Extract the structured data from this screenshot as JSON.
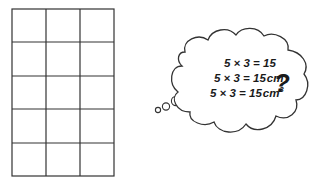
{
  "grid": {
    "columns": 3,
    "rows": 5,
    "x": 12,
    "y": 9,
    "width": 102,
    "height": 167,
    "stroke": "#333333"
  },
  "thought_bubble": {
    "equations": [
      {
        "lhs": "5 × 3 = 15",
        "unit": "",
        "superscript": ""
      },
      {
        "lhs": "5 × 3 = 15",
        "unit": "cm",
        "superscript": ""
      },
      {
        "lhs": "5 × 3 = 15",
        "unit": "cm",
        "superscript": "3"
      }
    ],
    "question_mark": "?"
  }
}
